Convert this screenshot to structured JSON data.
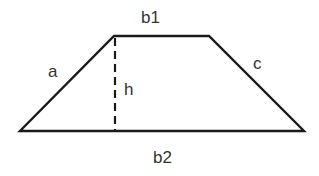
{
  "diagram": {
    "shape": "trapezoid",
    "vertices": {
      "top_left": [
        114,
        36
      ],
      "top_right": [
        209,
        36
      ],
      "bottom_right": [
        304,
        131
      ],
      "bottom_left": [
        20,
        131
      ]
    },
    "height_line": {
      "x": 115,
      "y_top": 38,
      "y_bottom": 131,
      "style": "dashed"
    },
    "labels": {
      "top_base": "b1",
      "left_side": "a",
      "height": "h",
      "right_side": "c",
      "bottom_base": "b2"
    },
    "colors": {
      "line": "#1a1a1a",
      "text": "#333333",
      "background": "#ffffff"
    }
  }
}
